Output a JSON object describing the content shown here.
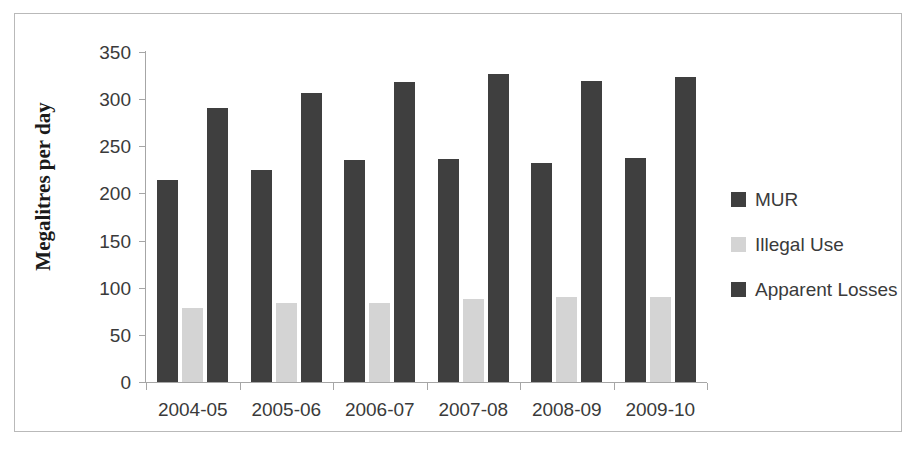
{
  "chart_data": {
    "type": "bar",
    "title": "",
    "xlabel": "",
    "ylabel": "Megalitres per day",
    "ylim": [
      0,
      350
    ],
    "ytick_step": 50,
    "yticks": [
      350,
      300,
      250,
      200,
      150,
      100,
      50,
      0
    ],
    "grid": false,
    "legend_position": "right",
    "categories": [
      "2004-05",
      "2005-06",
      "2006-07",
      "2007-08",
      "2008-09",
      "2009-10"
    ],
    "series": [
      {
        "name": "MUR",
        "color": "#3f3f3f",
        "values": [
          214,
          225,
          236,
          237,
          232,
          238
        ]
      },
      {
        "name": "Illegal Use",
        "color": "#d4d4d4",
        "values": [
          78,
          84,
          84,
          88,
          90,
          90
        ]
      },
      {
        "name": "Apparent Losses",
        "color": "#3f3f3f",
        "values": [
          291,
          307,
          318,
          327,
          319,
          323
        ]
      }
    ]
  },
  "legend": {
    "items": [
      {
        "label": "MUR",
        "color": "#3f3f3f"
      },
      {
        "label": "Illegal Use",
        "color": "#d4d4d4"
      },
      {
        "label": "Apparent Losses",
        "color": "#3f3f3f"
      }
    ]
  },
  "axes": {
    "y_title": "Megalitres per day",
    "y_labels": [
      "350",
      "300",
      "250",
      "200",
      "150",
      "100",
      "50",
      "0"
    ],
    "x_labels": [
      "2004-05",
      "2005-06",
      "2006-07",
      "2007-08",
      "2008-09",
      "2009-10"
    ]
  },
  "colors": {
    "series_dark": "#3f3f3f",
    "series_light": "#d4d4d4",
    "axis": "#a6a6a6",
    "text": "#3a3a3a",
    "frame": "#b9b9b9"
  }
}
